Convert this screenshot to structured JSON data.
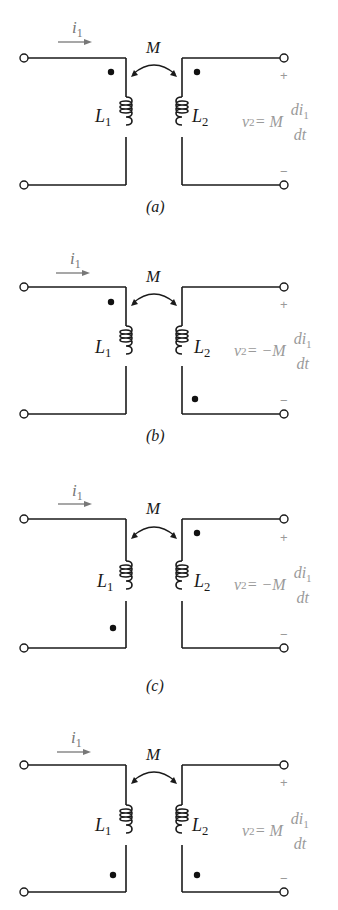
{
  "figure": {
    "colors": {
      "wire": "#1a1a1a",
      "arrow": "#777777",
      "equation": "#9a9a9a",
      "dot": "#111111"
    },
    "panels": [
      {
        "id": "a",
        "caption": "(a)",
        "current_label": "i",
        "current_sub": "1",
        "mutual_label": "M",
        "L1_label": "L",
        "L1_sub": "1",
        "L2_label": "L",
        "L2_sub": "2",
        "plus": "+",
        "minus": "−",
        "eq_lhs": "v",
        "eq_lhs_sub": "2",
        "eq_mid": " = M",
        "eq_num": "di",
        "eq_num_sub": "1",
        "eq_den": "dt",
        "dot_L1": "top",
        "dot_L2": "top"
      },
      {
        "id": "b",
        "caption": "(b)",
        "current_label": "i",
        "current_sub": "1",
        "mutual_label": "M",
        "L1_label": "L",
        "L1_sub": "1",
        "L2_label": "L",
        "L2_sub": "2",
        "plus": "+",
        "minus": "−",
        "eq_lhs": "v",
        "eq_lhs_sub": "2",
        "eq_mid": " = −M",
        "eq_num": "di",
        "eq_num_sub": "1",
        "eq_den": "dt",
        "dot_L1": "top",
        "dot_L2": "bottom"
      },
      {
        "id": "c",
        "caption": "(c)",
        "current_label": "i",
        "current_sub": "1",
        "mutual_label": "M",
        "L1_label": "L",
        "L1_sub": "1",
        "L2_label": "L",
        "L2_sub": "2",
        "plus": "+",
        "minus": "−",
        "eq_lhs": "v",
        "eq_lhs_sub": "2",
        "eq_mid": " = −M",
        "eq_num": "di",
        "eq_num_sub": "1",
        "eq_den": "dt",
        "dot_L1": "bottom",
        "dot_L2": "top"
      },
      {
        "id": "d",
        "caption": "",
        "current_label": "i",
        "current_sub": "1",
        "mutual_label": "M",
        "L1_label": "L",
        "L1_sub": "1",
        "L2_label": "L",
        "L2_sub": "2",
        "plus": "+",
        "minus": "−",
        "eq_lhs": "v",
        "eq_lhs_sub": "2",
        "eq_mid": " = M",
        "eq_num": "di",
        "eq_num_sub": "1",
        "eq_den": "dt",
        "dot_L1": "bottom",
        "dot_L2": "bottom"
      }
    ]
  }
}
